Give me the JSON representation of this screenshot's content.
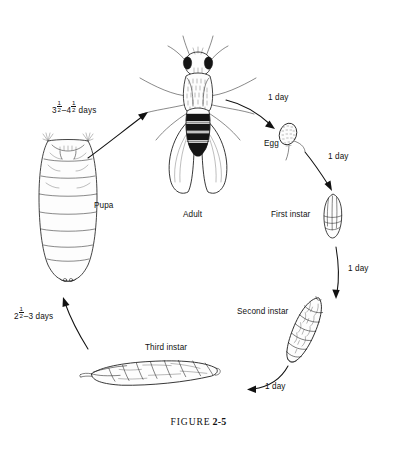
{
  "figure": {
    "caption_word": "FIGURE",
    "caption_number": "2-5",
    "caption_full": "FIGURE 2-5"
  },
  "stages": [
    {
      "id": "adult",
      "label": "Adult",
      "icon": "adult-fly-icon"
    },
    {
      "id": "egg",
      "label": "Egg",
      "icon": "egg-icon"
    },
    {
      "id": "first-instar",
      "label": "First instar",
      "icon": "first-instar-larva-icon"
    },
    {
      "id": "second-instar",
      "label": "Second instar",
      "icon": "second-instar-larva-icon"
    },
    {
      "id": "third-instar",
      "label": "Third instar",
      "icon": "third-instar-larva-icon"
    },
    {
      "id": "pupa",
      "label": "Pupa",
      "icon": "pupa-icon"
    }
  ],
  "transitions": [
    {
      "id": "adult-to-egg",
      "from": "adult",
      "to": "egg",
      "duration_text": "1 day",
      "duration_plain": "1 day"
    },
    {
      "id": "egg-to-first-instar",
      "from": "egg",
      "to": "first-instar",
      "duration_text": "1 day",
      "duration_plain": "1 day"
    },
    {
      "id": "first-to-second-instar",
      "from": "first-instar",
      "to": "second-instar",
      "duration_text": "1 day",
      "duration_plain": "1 day"
    },
    {
      "id": "second-to-third-instar",
      "from": "second-instar",
      "to": "third-instar",
      "duration_text": "1 day",
      "duration_plain": "1 day"
    },
    {
      "id": "third-instar-to-pupa",
      "from": "third-instar",
      "to": "pupa",
      "duration_whole_a": "2",
      "duration_frac_a_num": "1",
      "duration_frac_a_den": "2",
      "duration_tail": "–3 days",
      "duration_plain": "2½–3 days"
    },
    {
      "id": "pupa-to-adult",
      "from": "pupa",
      "to": "adult",
      "duration_whole_a": "3",
      "duration_frac_a_num": "1",
      "duration_frac_a_den": "2",
      "duration_dash": "–",
      "duration_whole_b": "4",
      "duration_frac_b_num": "1",
      "duration_frac_b_den": "2",
      "duration_tail": " days",
      "duration_plain": "3½–4½ days"
    }
  ],
  "colors": {
    "background": "#ffffff",
    "ink": "#151515",
    "text": "#111111"
  }
}
